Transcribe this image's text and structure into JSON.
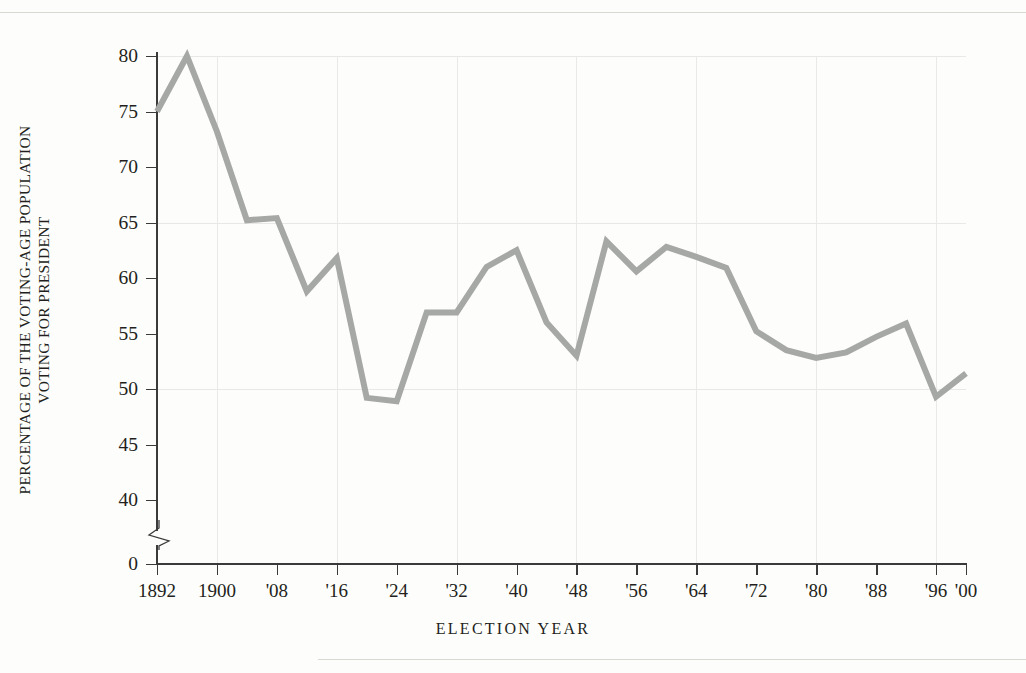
{
  "figure": {
    "axis_title_y_lines": [
      "PERCENTAGE OF THE VOTING-AGE POPULATION",
      "VOTING FOR PRESIDENT"
    ],
    "axis_title_x": "ELECTION  YEAR",
    "line_color": "#a6a8a5",
    "axis_color": "#3a3a3a",
    "grid_color": "#e8e8e6",
    "background": "#fdfdfb"
  },
  "y_axis": {
    "ticks": [
      {
        "value": 0,
        "label": "0"
      },
      {
        "value": 40,
        "label": "40"
      },
      {
        "value": 45,
        "label": "45"
      },
      {
        "value": 50,
        "label": "50"
      },
      {
        "value": 55,
        "label": "55"
      },
      {
        "value": 60,
        "label": "60"
      },
      {
        "value": 65,
        "label": "65"
      },
      {
        "value": 70,
        "label": "70"
      },
      {
        "value": 75,
        "label": "75"
      },
      {
        "value": 80,
        "label": "80"
      }
    ],
    "gridline_values": [
      50,
      65,
      80
    ],
    "has_axis_break": true,
    "break_between": [
      0,
      40
    ]
  },
  "x_axis": {
    "ticks": [
      {
        "year": 1892,
        "label": "1892"
      },
      {
        "year": 1900,
        "label": "1900"
      },
      {
        "year": 1908,
        "label": "'08"
      },
      {
        "year": 1916,
        "label": "'16"
      },
      {
        "year": 1924,
        "label": "'24"
      },
      {
        "year": 1932,
        "label": "'32"
      },
      {
        "year": 1940,
        "label": "'40"
      },
      {
        "year": 1948,
        "label": "'48"
      },
      {
        "year": 1956,
        "label": "'56"
      },
      {
        "year": 1964,
        "label": "'64"
      },
      {
        "year": 1972,
        "label": "'72"
      },
      {
        "year": 1980,
        "label": "'80"
      },
      {
        "year": 1988,
        "label": "'88"
      },
      {
        "year": 1996,
        "label": "'96"
      },
      {
        "year": 2000,
        "label": "'00"
      }
    ],
    "gridline_years": [
      1900,
      1916,
      1932,
      1948,
      1964,
      1980,
      1996
    ]
  },
  "chart_data": {
    "type": "line",
    "title": "",
    "xlabel": "ELECTION  YEAR",
    "ylabel": "PERCENTAGE OF THE VOTING-AGE POPULATION VOTING FOR PRESIDENT",
    "xlim": [
      1892,
      2000
    ],
    "ylim": [
      40,
      80
    ],
    "grid": true,
    "legend": "none",
    "x": [
      1892,
      1896,
      1900,
      1904,
      1908,
      1912,
      1916,
      1920,
      1924,
      1928,
      1932,
      1936,
      1940,
      1944,
      1948,
      1952,
      1956,
      1960,
      1964,
      1968,
      1972,
      1976,
      1980,
      1984,
      1988,
      1992,
      1996,
      2000
    ],
    "values": [
      75.0,
      80.0,
      73.2,
      65.2,
      65.4,
      58.8,
      61.8,
      49.2,
      48.9,
      56.9,
      56.9,
      61.0,
      62.5,
      56.0,
      53.0,
      63.3,
      60.6,
      62.8,
      61.9,
      60.9,
      55.2,
      53.5,
      52.8,
      53.3,
      54.7,
      52.2,
      55.9,
      49.3
    ],
    "series": [
      {
        "name": "Voter turnout",
        "points": [
          {
            "year": 1892,
            "value": 75.0
          },
          {
            "year": 1896,
            "value": 80.0
          },
          {
            "year": 1900,
            "value": 73.2
          },
          {
            "year": 1904,
            "value": 65.2
          },
          {
            "year": 1908,
            "value": 65.4
          },
          {
            "year": 1912,
            "value": 58.8
          },
          {
            "year": 1916,
            "value": 61.8
          },
          {
            "year": 1920,
            "value": 49.2
          },
          {
            "year": 1924,
            "value": 48.9
          },
          {
            "year": 1928,
            "value": 56.9
          },
          {
            "year": 1932,
            "value": 56.9
          },
          {
            "year": 1936,
            "value": 61.0
          },
          {
            "year": 1940,
            "value": 62.5
          },
          {
            "year": 1944,
            "value": 56.0
          },
          {
            "year": 1948,
            "value": 53.0
          },
          {
            "year": 1952,
            "value": 63.3
          },
          {
            "year": 1956,
            "value": 60.6
          },
          {
            "year": 1960,
            "value": 62.8
          },
          {
            "year": 1964,
            "value": 61.9
          },
          {
            "year": 1968,
            "value": 60.9
          },
          {
            "year": 1972,
            "value": 55.2
          },
          {
            "year": 1976,
            "value": 53.5
          },
          {
            "year": 1980,
            "value": 52.8
          },
          {
            "year": 1984,
            "value": 53.3
          },
          {
            "year": 1988,
            "value": 54.7
          },
          {
            "year": 1992,
            "value": 55.9
          },
          {
            "year": 1996,
            "value": 49.3
          },
          {
            "year": 2000,
            "value": 51.4
          }
        ]
      }
    ]
  }
}
